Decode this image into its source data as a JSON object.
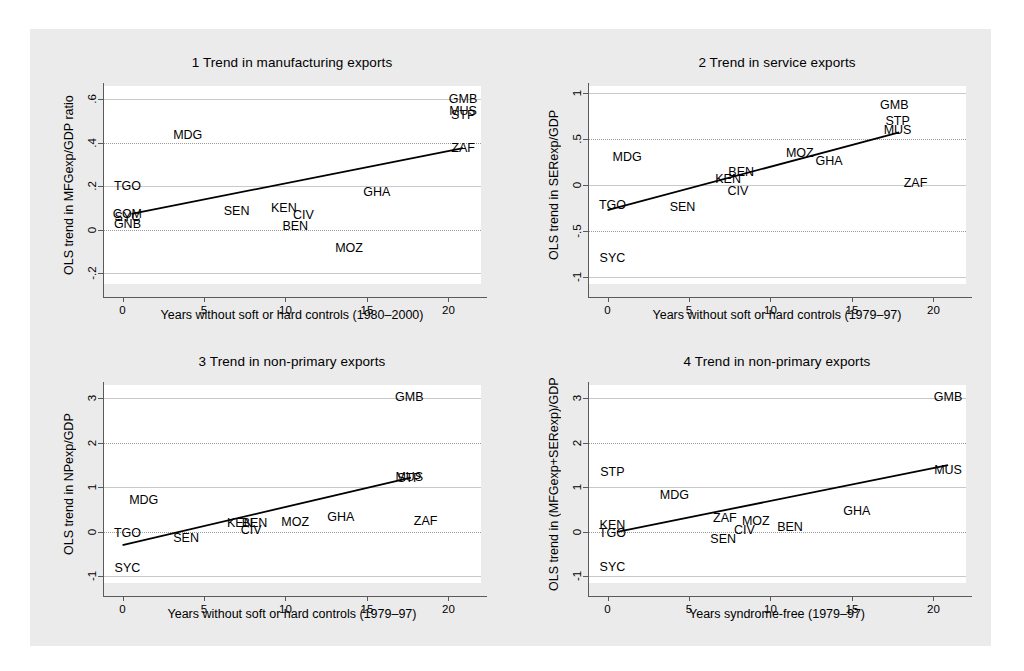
{
  "figure": {
    "background": "#ebebeb",
    "plot_background": "#ffffff",
    "line_color": "#000000",
    "grid_color": "#9a9a9a"
  },
  "chart_data": [
    {
      "type": "scatter",
      "panel_number": "1",
      "title": "1  Trend in manufacturing exports",
      "ylabel": "OLS trend in MFGexp/GDP ratio",
      "xlabel": "Years without soft or hard controls (1980–2000)",
      "xlim": [
        -1.2,
        22.0
      ],
      "ylim": [
        -0.25,
        0.66
      ],
      "xticks": [
        "0",
        "5",
        "10",
        "15",
        "20"
      ],
      "xtickvals": [
        0,
        5,
        10,
        15,
        20
      ],
      "yticks": [
        ".6",
        ".4",
        ".2",
        "0",
        "-.2"
      ],
      "ytickvals": [
        0.6,
        0.4,
        0.2,
        0,
        -0.2
      ],
      "grid": true,
      "legend": "none",
      "points": [
        {
          "label": "GMB",
          "x": 20.9,
          "y": 0.6
        },
        {
          "label": "MUS",
          "x": 20.9,
          "y": 0.545
        },
        {
          "label": "STP",
          "x": 20.9,
          "y": 0.525
        },
        {
          "label": "MDG",
          "x": 4.0,
          "y": 0.435
        },
        {
          "label": "ZAF",
          "x": 20.9,
          "y": 0.375
        },
        {
          "label": "TGO",
          "x": 0.3,
          "y": 0.2
        },
        {
          "label": "GHA",
          "x": 15.6,
          "y": 0.175
        },
        {
          "label": "SEN",
          "x": 7.0,
          "y": 0.085
        },
        {
          "label": "KEN",
          "x": 9.9,
          "y": 0.097
        },
        {
          "label": "CIV",
          "x": 11.1,
          "y": 0.065
        },
        {
          "label": "COM",
          "x": 0.3,
          "y": 0.072
        },
        {
          "label": "SYC",
          "x": 0.3,
          "y": 0.06
        },
        {
          "label": "GNB",
          "x": 0.3,
          "y": 0.028
        },
        {
          "label": "BEN",
          "x": 10.6,
          "y": 0.018
        },
        {
          "label": "MOZ",
          "x": 13.9,
          "y": -0.085
        }
      ],
      "fit_line": {
        "x0": 0.55,
        "y0": 0.072,
        "x1": 20.9,
        "y1": 0.375
      }
    },
    {
      "type": "scatter",
      "panel_number": "2",
      "title": "2  Trend in service exports",
      "ylabel": "OLS trend in SERexp/GDP",
      "xlabel": "Years without soft or hard controls (1979–97)",
      "xlim": [
        -1.2,
        22.0
      ],
      "ylim": [
        -1.08,
        1.08
      ],
      "xticks": [
        "0",
        "5",
        "10",
        "15",
        "20"
      ],
      "xtickvals": [
        0,
        5,
        10,
        15,
        20
      ],
      "yticks": [
        "1",
        ".5",
        "0",
        "-.5",
        "-1"
      ],
      "ytickvals": [
        1,
        0.5,
        0,
        -0.5,
        -1
      ],
      "grid": true,
      "legend": "none",
      "points": [
        {
          "label": "GMB",
          "x": 17.6,
          "y": 0.875
        },
        {
          "label": "STP",
          "x": 17.8,
          "y": 0.7
        },
        {
          "label": "MUS",
          "x": 17.8,
          "y": 0.595
        },
        {
          "label": "MOZ",
          "x": 11.8,
          "y": 0.345
        },
        {
          "label": "MDG",
          "x": 1.2,
          "y": 0.305
        },
        {
          "label": "GHA",
          "x": 13.6,
          "y": 0.265
        },
        {
          "label": "BEN",
          "x": 8.2,
          "y": 0.145
        },
        {
          "label": "KEN",
          "x": 7.4,
          "y": 0.065
        },
        {
          "label": "ZAF",
          "x": 18.9,
          "y": 0.025
        },
        {
          "label": "CIV",
          "x": 8.0,
          "y": -0.065
        },
        {
          "label": "TGO",
          "x": 0.3,
          "y": -0.215
        },
        {
          "label": "SEN",
          "x": 4.6,
          "y": -0.235
        },
        {
          "label": "SYC",
          "x": 0.3,
          "y": -0.795
        }
      ],
      "fit_line": {
        "x0": 0.0,
        "y0": -0.275,
        "x1": 17.9,
        "y1": 0.575
      }
    },
    {
      "type": "scatter",
      "panel_number": "3",
      "title": "3  Trend in non-primary exports",
      "ylabel": "OLS trend in NPexp/GDP",
      "xlabel": "Years without soft or hard controls (1979–97)",
      "xlim": [
        -1.2,
        22.0
      ],
      "ylim": [
        -1.15,
        3.3
      ],
      "xticks": [
        "0",
        "5",
        "10",
        "15",
        "20"
      ],
      "xtickvals": [
        0,
        5,
        10,
        15,
        20
      ],
      "yticks": [
        "3",
        "2",
        "1",
        "0",
        "-1"
      ],
      "ytickvals": [
        3,
        2,
        1,
        0,
        -1
      ],
      "grid": true,
      "legend": "none",
      "points": [
        {
          "label": "GMB",
          "x": 17.6,
          "y": 3.03
        },
        {
          "label": "MUS",
          "x": 17.6,
          "y": 1.23
        },
        {
          "label": "STP",
          "x": 17.6,
          "y": 1.21
        },
        {
          "label": "MDG",
          "x": 1.3,
          "y": 0.72
        },
        {
          "label": "GHA",
          "x": 13.4,
          "y": 0.34
        },
        {
          "label": "MOZ",
          "x": 10.6,
          "y": 0.23
        },
        {
          "label": "ZAF",
          "x": 18.6,
          "y": 0.25
        },
        {
          "label": "KEN",
          "x": 7.2,
          "y": 0.2
        },
        {
          "label": "BEN",
          "x": 8.1,
          "y": 0.2
        },
        {
          "label": "CIV",
          "x": 7.9,
          "y": 0.05
        },
        {
          "label": "TGO",
          "x": 0.3,
          "y": -0.02
        },
        {
          "label": "SEN",
          "x": 3.9,
          "y": -0.145
        },
        {
          "label": "SYC",
          "x": 0.3,
          "y": -0.82
        }
      ],
      "fit_line": {
        "x0": 0.0,
        "y0": -0.3,
        "x1": 17.7,
        "y1": 1.22
      }
    },
    {
      "type": "scatter",
      "panel_number": "4",
      "title": "4  Trend in non-primary exports",
      "ylabel": "OLS trend in (MFGexp+SERexp)/GDP",
      "xlabel": "Years syndrome-free (1979–97)",
      "xlim": [
        -1.2,
        22.0
      ],
      "ylim": [
        -1.15,
        3.3
      ],
      "xticks": [
        "0",
        "5",
        "10",
        "15",
        "20"
      ],
      "xtickvals": [
        0,
        5,
        10,
        15,
        20
      ],
      "yticks": [
        "3",
        "2",
        "1",
        "0",
        "-1"
      ],
      "ytickvals": [
        3,
        2,
        1,
        0,
        -1
      ],
      "grid": true,
      "legend": "none",
      "points": [
        {
          "label": "GMB",
          "x": 20.9,
          "y": 3.03
        },
        {
          "label": "MUS",
          "x": 20.9,
          "y": 1.38
        },
        {
          "label": "STP",
          "x": 0.3,
          "y": 1.35
        },
        {
          "label": "MDG",
          "x": 4.1,
          "y": 0.83
        },
        {
          "label": "GHA",
          "x": 15.3,
          "y": 0.46
        },
        {
          "label": "ZAF",
          "x": 7.2,
          "y": 0.32
        },
        {
          "label": "MOZ",
          "x": 9.1,
          "y": 0.24
        },
        {
          "label": "KEN",
          "x": 0.3,
          "y": 0.15
        },
        {
          "label": "BEN",
          "x": 11.2,
          "y": 0.11
        },
        {
          "label": "CIV",
          "x": 8.4,
          "y": 0.03
        },
        {
          "label": "TGO",
          "x": 0.3,
          "y": -0.03
        },
        {
          "label": "SEN",
          "x": 7.1,
          "y": -0.16
        },
        {
          "label": "SYC",
          "x": 0.3,
          "y": -0.8
        }
      ],
      "fit_line": {
        "x0": 0.6,
        "y0": 0.0,
        "x1": 20.9,
        "y1": 1.5
      }
    }
  ]
}
